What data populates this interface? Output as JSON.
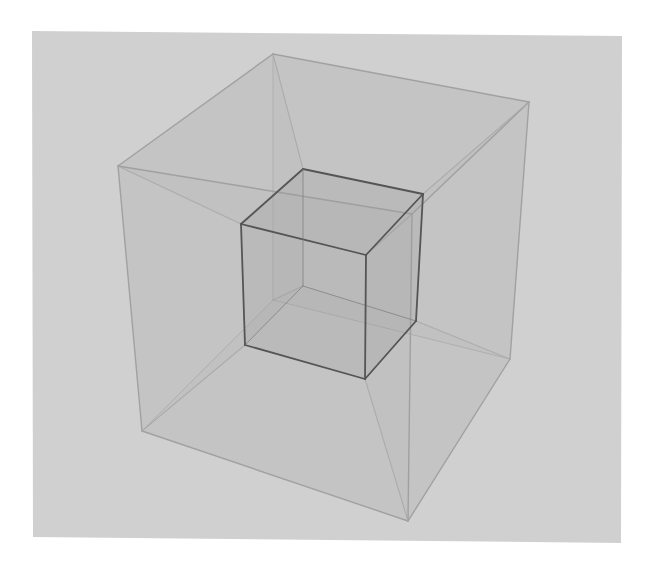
{
  "figure": {
    "title": "",
    "colors": {
      "page": "#ffffff",
      "panel": "#d0d0d0",
      "outer_fill": "#b8b8b8",
      "inner_fill": "#9a9a9a",
      "outer_edge": "#9c9c9c",
      "inner_edge": "#555555",
      "connector_edge": "#a8a8a8"
    },
    "outer_cube": {
      "vertices": {
        "top_left": [
          118,
          166
        ],
        "top_back": [
          273,
          54
        ],
        "top_right": [
          529,
          102
        ],
        "top_front": [
          412,
          214
        ],
        "bottom_left": [
          142,
          431
        ],
        "bottom_back": [
          273,
          300
        ],
        "bottom_right": [
          510,
          359
        ],
        "bottom_front": [
          408,
          521
        ]
      }
    },
    "inner_cube": {
      "vertices": {
        "top_left": [
          241,
          224
        ],
        "top_back": [
          303,
          169
        ],
        "top_right": [
          423,
          194
        ],
        "top_front": [
          366,
          255
        ],
        "bottom_left": [
          245,
          345
        ],
        "bottom_back": [
          303,
          286
        ],
        "bottom_right": [
          416,
          321
        ],
        "bottom_front": [
          365,
          379
        ]
      }
    }
  }
}
